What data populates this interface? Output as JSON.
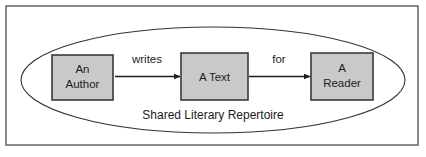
{
  "figure": {
    "frame": {
      "border_color": "#6e6e6e",
      "background_color": "#ffffff"
    },
    "grouping": {
      "shape": "ellipse",
      "name": "shared-literary-repertoire-ellipse",
      "caption": "Shared Literary Repertoire",
      "stroke_color": "#333333",
      "fill_color": "none"
    },
    "nodes": [
      {
        "id": "author",
        "lines": [
          "An",
          "Author"
        ],
        "fill_color": "#c9c9c9",
        "stroke_color": "#3a3a3a"
      },
      {
        "id": "text",
        "lines": [
          "A Text"
        ],
        "fill_color": "#c9c9c9",
        "stroke_color": "#3a3a3a"
      },
      {
        "id": "reader",
        "lines": [
          "A",
          "Reader"
        ],
        "fill_color": "#c9c9c9",
        "stroke_color": "#3a3a3a"
      }
    ],
    "edges": [
      {
        "id": "author-to-text",
        "label": "writes",
        "from": "author",
        "to": "text",
        "color": "#1c1c1c"
      },
      {
        "id": "text-to-reader",
        "label": "for",
        "from": "text",
        "to": "reader",
        "color": "#1c1c1c"
      }
    ]
  }
}
